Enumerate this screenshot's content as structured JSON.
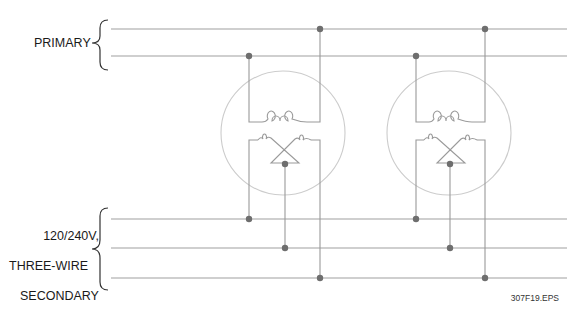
{
  "labels": {
    "primary": "PRIMARY",
    "secondary_line1": "120/240V,",
    "secondary_line2": "THREE-WIRE",
    "secondary_line3": "SECONDARY",
    "figure_id": "307F19.EPS"
  },
  "diagram": {
    "primary_lines": 2,
    "secondary_lines": 3,
    "transformers": 2,
    "colors": {
      "line": "#9a9a9a",
      "dot": "#6e6e6e",
      "circle": "#c8c8c8",
      "text": "#1a1a1a"
    }
  }
}
